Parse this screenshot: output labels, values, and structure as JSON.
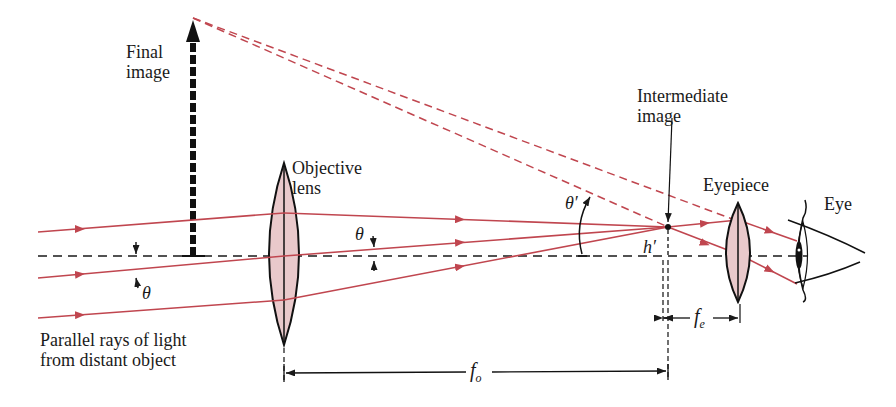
{
  "labels": {
    "final_image": [
      "Final",
      "image"
    ],
    "objective_lens": [
      "Objective",
      "lens"
    ],
    "intermediate_image": [
      "Intermediate",
      "image"
    ],
    "eyepiece": "Eyepiece",
    "eye": "Eye",
    "parallel_rays": [
      "Parallel rays of light",
      "from distant object"
    ],
    "theta": "θ",
    "theta_prime": "θ′",
    "h_prime": "h′",
    "f_o": {
      "main": "f",
      "sub": "o"
    },
    "f_e": {
      "main": "f",
      "sub": "e"
    }
  },
  "colors": {
    "ray": "#c0464f",
    "lens_fill": "#e9c9cb",
    "line": "#1a1a1a"
  }
}
